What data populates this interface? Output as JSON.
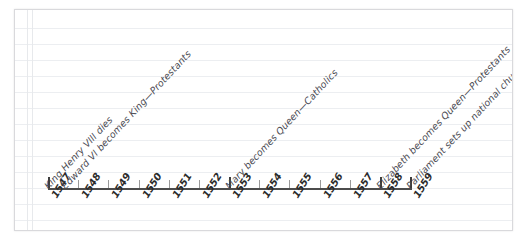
{
  "page": {
    "background_color": "#ffffff",
    "paper_color": "#ffffff",
    "rule_color": "#eceef1",
    "border_color": "#d9d9dc"
  },
  "chart_data": {
    "type": "timeline",
    "title": "",
    "xlabel": "",
    "ylabel": "",
    "axis_color": "#4c4c4c",
    "categories": [
      "1547",
      "1548",
      "1549",
      "1550",
      "1551",
      "1552",
      "1553",
      "1554",
      "1555",
      "1556",
      "1557",
      "1558",
      "1559"
    ],
    "xlim": [
      1547,
      1559
    ],
    "grid": false,
    "legend": "none",
    "major_ticks": [
      "1547",
      "1553",
      "1558",
      "1559"
    ],
    "events": [
      {
        "year": "1547",
        "label": "King Henry VIII dies"
      },
      {
        "year": "1547",
        "label": "Edward VI becomes King—Protestants"
      },
      {
        "year": "1553",
        "label": "Mary becomes Queen—Catholics"
      },
      {
        "year": "1558",
        "label": "Elizabeth becomes Queen—Protestants"
      },
      {
        "year": "1559",
        "label": "Parliament sets up national church"
      }
    ]
  }
}
